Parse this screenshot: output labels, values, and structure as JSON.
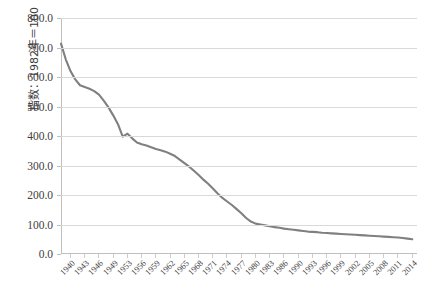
{
  "chart_data": {
    "type": "line",
    "title": "",
    "xlabel": "",
    "ylabel": "指数：1982年＝100",
    "ylim": [
      0,
      800
    ],
    "yticks": [
      "0.0",
      "100.0",
      "200.0",
      "300.0",
      "400.0",
      "500.0",
      "600.0",
      "700.0",
      "800.0"
    ],
    "ytick_values": [
      0,
      100,
      200,
      300,
      400,
      500,
      600,
      700,
      800
    ],
    "grid": true,
    "legend": "none",
    "line_color": "#808080",
    "gridline_color": "#d9d9d9",
    "background_color": "#ffffff",
    "xtick_labels": [
      "1940",
      "1943",
      "1946",
      "1949",
      "1953",
      "1956",
      "1959",
      "1962",
      "1965",
      "1968",
      "1971",
      "1974",
      "1977",
      "1980",
      "1983",
      "1986",
      "1990",
      "1993",
      "1996",
      "1999",
      "2002",
      "2005",
      "2008",
      "2011",
      "2014"
    ],
    "xlim": [
      1940,
      2015
    ],
    "x": [
      1940,
      1941,
      1942,
      1943,
      1944,
      1945,
      1946,
      1947,
      1948,
      1949,
      1950,
      1951,
      1952,
      1953,
      1954,
      1955,
      1956,
      1957,
      1958,
      1959,
      1960,
      1961,
      1962,
      1963,
      1964,
      1965,
      1966,
      1967,
      1968,
      1969,
      1970,
      1971,
      1972,
      1973,
      1974,
      1975,
      1976,
      1977,
      1978,
      1979,
      1980,
      1981,
      1982,
      1983,
      1984,
      1985,
      1986,
      1987,
      1988,
      1989,
      1990,
      1991,
      1992,
      1993,
      1994,
      1995,
      1996,
      1997,
      1998,
      1999,
      2000,
      2001,
      2002,
      2003,
      2004,
      2005,
      2006,
      2007,
      2008,
      2009,
      2010,
      2011,
      2012,
      2013,
      2014
    ],
    "values": [
      713,
      660,
      620,
      592,
      572,
      566,
      560,
      552,
      540,
      520,
      497,
      470,
      440,
      398,
      408,
      392,
      378,
      372,
      368,
      362,
      356,
      352,
      347,
      340,
      332,
      320,
      308,
      296,
      282,
      268,
      252,
      238,
      222,
      205,
      190,
      178,
      166,
      152,
      138,
      122,
      110,
      103,
      100,
      97,
      94,
      91,
      89,
      86,
      84,
      82,
      80,
      78,
      76,
      75,
      74,
      72,
      71,
      70,
      69,
      68,
      67,
      66,
      65,
      64,
      63,
      62,
      61,
      60,
      59,
      58,
      57,
      56,
      54,
      52,
      50
    ],
    "annotations": []
  }
}
